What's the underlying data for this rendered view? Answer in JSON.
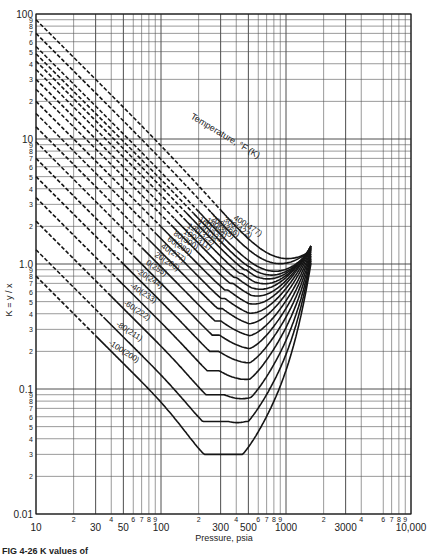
{
  "chart_data": {
    "type": "line",
    "title": "",
    "caption": "FIG 4-26  K values of",
    "xlabel": "Pressure, psia",
    "ylabel": "K = y / x",
    "xscale": "log",
    "yscale": "log",
    "xlim": [
      10,
      10000
    ],
    "ylim": [
      0.01,
      100
    ],
    "grid": true,
    "legend_title": "Temperature, °F (K)",
    "x_tick_labels": [
      {
        "value": 10,
        "label": "10"
      },
      {
        "value": 20,
        "label": "2",
        "small": true
      },
      {
        "value": 30,
        "label": "30"
      },
      {
        "value": 40,
        "label": "4",
        "small": true
      },
      {
        "value": 50,
        "label": "50"
      },
      {
        "value": 60,
        "label": "6",
        "small": true
      },
      {
        "value": 70,
        "label": "7",
        "small": true
      },
      {
        "value": 80,
        "label": "8",
        "small": true
      },
      {
        "value": 90,
        "label": "9",
        "small": true
      },
      {
        "value": 100,
        "label": "100"
      },
      {
        "value": 200,
        "label": "2",
        "small": true
      },
      {
        "value": 300,
        "label": "300"
      },
      {
        "value": 400,
        "label": "4",
        "small": true
      },
      {
        "value": 500,
        "label": "500"
      },
      {
        "value": 600,
        "label": "6",
        "small": true
      },
      {
        "value": 700,
        "label": "7",
        "small": true
      },
      {
        "value": 800,
        "label": "8",
        "small": true
      },
      {
        "value": 900,
        "label": "9",
        "small": true
      },
      {
        "value": 1000,
        "label": "1000"
      },
      {
        "value": 2000,
        "label": "2",
        "small": true
      },
      {
        "value": 3000,
        "label": "3000"
      },
      {
        "value": 4000,
        "label": "4",
        "small": true
      },
      {
        "value": 6000,
        "label": "6",
        "small": true
      },
      {
        "value": 7000,
        "label": "7",
        "small": true
      },
      {
        "value": 8000,
        "label": "8",
        "small": true
      },
      {
        "value": 9000,
        "label": "9",
        "small": true
      },
      {
        "value": 10000,
        "label": "10,000"
      }
    ],
    "y_tick_labels": [
      {
        "value": 100,
        "label": "100"
      },
      {
        "value": 90,
        "label": "9"
      },
      {
        "value": 80,
        "label": "8"
      },
      {
        "value": 70,
        "label": "7"
      },
      {
        "value": 60,
        "label": "6"
      },
      {
        "value": 50,
        "label": "5"
      },
      {
        "value": 40,
        "label": "4"
      },
      {
        "value": 30,
        "label": "3"
      },
      {
        "value": 20,
        "label": "2"
      },
      {
        "value": 10,
        "label": "10"
      },
      {
        "value": 9,
        "label": "9"
      },
      {
        "value": 8,
        "label": "8"
      },
      {
        "value": 7,
        "label": "7"
      },
      {
        "value": 6,
        "label": "6"
      },
      {
        "value": 5,
        "label": "5"
      },
      {
        "value": 4,
        "label": "4"
      },
      {
        "value": 3,
        "label": "3"
      },
      {
        "value": 2,
        "label": "2"
      },
      {
        "value": 1,
        "label": "1.0"
      },
      {
        "value": 0.9,
        "label": "9"
      },
      {
        "value": 0.8,
        "label": "8"
      },
      {
        "value": 0.7,
        "label": "7"
      },
      {
        "value": 0.6,
        "label": "6"
      },
      {
        "value": 0.5,
        "label": "5"
      },
      {
        "value": 0.4,
        "label": "4"
      },
      {
        "value": 0.3,
        "label": "3"
      },
      {
        "value": 0.2,
        "label": "2"
      },
      {
        "value": 0.1,
        "label": "0.1"
      },
      {
        "value": 0.09,
        "label": "9"
      },
      {
        "value": 0.08,
        "label": "8"
      },
      {
        "value": 0.07,
        "label": "7"
      },
      {
        "value": 0.06,
        "label": "6"
      },
      {
        "value": 0.05,
        "label": "5"
      },
      {
        "value": 0.04,
        "label": "4"
      },
      {
        "value": 0.03,
        "label": "3"
      },
      {
        "value": 0.02,
        "label": "2"
      },
      {
        "value": 0.01,
        "label": "0.01"
      }
    ],
    "convergence_pressure_psia": 1600,
    "series": [
      {
        "name": "400(477)",
        "k_at_10": 90,
        "k_min": 1.15,
        "p_min": 1300,
        "dash_until": 300
      },
      {
        "name": "300(422)",
        "k_at_10": 70,
        "k_min": 1.1,
        "p_min": 1250,
        "dash_until": 250
      },
      {
        "name": "200(366)",
        "k_at_10": 55,
        "k_min": 1.0,
        "p_min": 1200,
        "dash_until": 200
      },
      {
        "name": "180(355)",
        "k_at_10": 48,
        "k_min": 0.95,
        "p_min": 1150,
        "dash_until": 180
      },
      {
        "name": "160(344)",
        "k_at_10": 42,
        "k_min": 0.9,
        "p_min": 1100,
        "dash_until": 160
      },
      {
        "name": "140(333)",
        "k_at_10": 36,
        "k_min": 0.84,
        "p_min": 1050,
        "dash_until": 150
      },
      {
        "name": "120(322)",
        "k_at_10": 30,
        "k_min": 0.78,
        "p_min": 1000,
        "dash_until": 130
      },
      {
        "name": "100(311)",
        "k_at_10": 25,
        "k_min": 0.7,
        "p_min": 950,
        "dash_until": 120
      },
      {
        "name": "80(300)",
        "k_at_10": 20,
        "k_min": 0.62,
        "p_min": 900,
        "dash_until": 100
      },
      {
        "name": "60(289)",
        "k_at_10": 16,
        "k_min": 0.53,
        "p_min": 850,
        "dash_until": 90
      },
      {
        "name": "40(277)",
        "k_at_10": 12.5,
        "k_min": 0.44,
        "p_min": 800,
        "dash_until": 80
      },
      {
        "name": "20(266)",
        "k_at_10": 9.5,
        "k_min": 0.35,
        "p_min": 750,
        "dash_until": 70
      },
      {
        "name": "0(255)",
        "k_at_10": 7,
        "k_min": 0.27,
        "p_min": 700,
        "dash_until": 60
      },
      {
        "name": "-20(244)",
        "k_at_10": 5,
        "k_min": 0.2,
        "p_min": 650,
        "dash_until": 50
      },
      {
        "name": "-40(233)",
        "k_at_10": 3.4,
        "k_min": 0.14,
        "p_min": 600,
        "dash_until": 45
      },
      {
        "name": "-60(222)",
        "k_at_10": 2.2,
        "k_min": 0.09,
        "p_min": 550,
        "dash_until": 40
      },
      {
        "name": "-80(211)",
        "k_at_10": 1.3,
        "k_min": 0.055,
        "p_min": 500,
        "dash_until": 35
      },
      {
        "name": "-100(200)",
        "k_at_10": 0.8,
        "k_min": 0.03,
        "p_min": 450,
        "dash_until": 30
      }
    ]
  },
  "labels": {
    "legend_title": "Temperature, °F (K)",
    "xlabel": "Pressure, psia",
    "ylabel": "K = y / x",
    "caption": "FIG 4-26  K values of"
  }
}
